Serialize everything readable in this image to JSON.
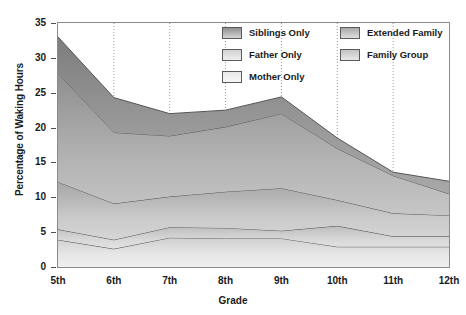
{
  "chart_data": {
    "type": "area",
    "stacked": true,
    "title": "",
    "xlabel": "Grade",
    "ylabel": "Percentage of Waking Hours",
    "categories": [
      "5th",
      "6th",
      "7th",
      "8th",
      "9th",
      "10th",
      "11th",
      "12th"
    ],
    "ylim": [
      0,
      35
    ],
    "yticks": [
      0,
      5,
      10,
      15,
      20,
      25,
      30,
      35
    ],
    "grid": "vertical-dotted",
    "legend_position": "top-right-inside",
    "series": [
      {
        "name": "Mother Only",
        "color": "#e3e3e3",
        "values": [
          3.9,
          2.6,
          4.2,
          4.1,
          4.1,
          2.9,
          2.9,
          2.9
        ]
      },
      {
        "name": "Father Only",
        "color": "#d2d2d2",
        "values": [
          1.5,
          1.3,
          1.5,
          1.5,
          1.1,
          3.0,
          1.5,
          1.5
        ]
      },
      {
        "name": "Family Group",
        "color": "#c2c2c2",
        "values": [
          6.8,
          5.2,
          4.4,
          5.2,
          6.1,
          3.7,
          3.3,
          5.0
        ]
      },
      {
        "name": "Extended Family",
        "color": "#a9a9a9",
        "values": [
          15.6,
          10.2,
          8.7,
          9.3,
          10.7,
          7.4,
          5.4,
          3.1
        ]
      },
      {
        "name": "Siblings Only",
        "color": "#8f8f8f",
        "values": [
          5.2,
          5.0,
          3.2,
          2.4,
          2.4,
          1.5,
          0.5,
          1.8
        ]
      }
    ],
    "stacked_tops": {
      "mother_only": [
        3.9,
        2.6,
        4.2,
        4.1,
        4.1,
        2.9,
        2.9,
        2.9
      ],
      "father_only": [
        5.4,
        3.9,
        5.7,
        5.6,
        5.2,
        5.9,
        4.4,
        4.4
      ],
      "family_group": [
        12.2,
        9.1,
        10.1,
        10.8,
        11.3,
        9.6,
        7.7,
        7.4
      ],
      "extended_family": [
        27.8,
        19.3,
        18.8,
        20.1,
        22.0,
        17.0,
        13.1,
        10.5
      ],
      "siblings_only": [
        33.0,
        24.3,
        22.0,
        22.5,
        24.4,
        18.5,
        13.6,
        12.3
      ],
      "total": [
        33.0,
        24.3,
        22.0,
        22.5,
        24.4,
        18.5,
        13.6,
        14.3
      ]
    }
  },
  "axis": {
    "y_title": "Percentage of Waking Hours",
    "x_title": "Grade",
    "y_tick_labels": [
      "35",
      "30",
      "25",
      "20",
      "15",
      "10",
      "5",
      "0"
    ],
    "x_tick_labels": [
      "5th",
      "6th",
      "7th",
      "8th",
      "9th",
      "10th",
      "11th",
      "12th"
    ]
  },
  "legend": {
    "column1": [
      {
        "label": "Siblings Only",
        "color": "#8f8f8f"
      },
      {
        "label": "Father Only",
        "color": "#d2d2d2"
      },
      {
        "label": "Mother Only",
        "color": "#e8e8e8"
      }
    ],
    "column2": [
      {
        "label": "Extended Family",
        "color": "#a9a9a9"
      },
      {
        "label": "Family Group",
        "color": "#c2c2c2"
      }
    ]
  },
  "colors": {
    "frame": "#8a8a8a",
    "gridline": "#9a9a9a",
    "text": "#1a1a1a",
    "background": "#ffffff"
  }
}
